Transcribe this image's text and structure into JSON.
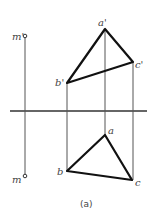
{
  "figure": {
    "caption": "(a)",
    "axis": {
      "x1": 10,
      "x2": 147,
      "y": 111
    },
    "points": {
      "m_prime": {
        "label": "m'",
        "x": 25,
        "y": 36
      },
      "m": {
        "label": "m",
        "x": 25,
        "y": 176
      },
      "a_prime": {
        "label": "a'",
        "x": 105,
        "y": 29
      },
      "b_prime": {
        "label": "b'",
        "x": 67,
        "y": 83
      },
      "c_prime": {
        "label": "c'",
        "x": 133,
        "y": 62
      },
      "a": {
        "label": "a",
        "x": 105,
        "y": 135
      },
      "b": {
        "label": "b",
        "x": 67,
        "y": 171
      },
      "c": {
        "label": "c",
        "x": 132,
        "y": 180
      }
    },
    "labels": {
      "m_prime": "m'",
      "m": "m",
      "a_prime": "a'",
      "b_prime": "b'",
      "c_prime": "c'",
      "a": "a",
      "b": "b",
      "c": "c"
    }
  }
}
